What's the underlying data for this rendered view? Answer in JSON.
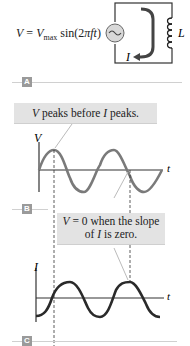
{
  "panels": {
    "a": {
      "label": "A",
      "equation": {
        "lhs": "V",
        "equals": " = ",
        "vmax": "V",
        "vmax_sub": "max",
        "func": " sin(2",
        "pi": "π",
        "ft": "ft",
        "close": ")"
      },
      "inductor_label": "L",
      "current_label": "I"
    },
    "b": {
      "label": "B",
      "callout": "V peaks before I peaks.",
      "callout_parts": {
        "v": "V",
        "mid": " peaks before ",
        "i": "I",
        "end": " peaks."
      },
      "y_axis_label": "V",
      "x_axis_label": "t"
    },
    "c": {
      "label": "C",
      "callout_line1_parts": {
        "v": "V",
        "mid": " = 0 when the slope"
      },
      "callout_line2_parts": {
        "pre": "of ",
        "i": "I",
        "end": " is zero."
      },
      "y_axis_label": "I",
      "x_axis_label": "t"
    }
  },
  "colors": {
    "voltage_curve": "#7a7a7a",
    "current_curve": "#2a2a2a",
    "callout_bg": "#e3e3e3",
    "panel_label_bg": "#9a9a9a",
    "source_fill": "#d8d8d8"
  }
}
